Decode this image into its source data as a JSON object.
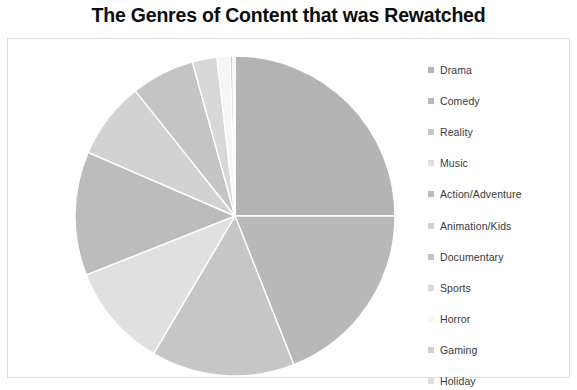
{
  "title": "The Genres of Content that was Rewatched",
  "legend": {
    "position": "right",
    "items": [
      {
        "label": "Drama",
        "color": "#b4b4b4"
      },
      {
        "label": "Comedy",
        "color": "#b8b8b8"
      },
      {
        "label": "Reality",
        "color": "#c6c6c6"
      },
      {
        "label": "Music",
        "color": "#e0e0e0"
      },
      {
        "label": "Action/Adventure",
        "color": "#bcbcbc"
      },
      {
        "label": "Animation/Kids",
        "color": "#d2d2d2"
      },
      {
        "label": "Documentary",
        "color": "#c4c4c4"
      },
      {
        "label": "Sports",
        "color": "#d8d8d8"
      },
      {
        "label": "Horror",
        "color": "#f6f6f6"
      },
      {
        "label": "Gaming",
        "color": "#cfcfcf"
      },
      {
        "label": "Holiday",
        "color": "#dedede"
      }
    ]
  },
  "chart_data": {
    "type": "pie",
    "title": "The Genres of Content that was Rewatched",
    "xlabel": "",
    "ylabel": "",
    "start_angle_deg": 0,
    "direction": "clockwise",
    "center": {
      "x": 235,
      "y": 216
    },
    "radius": 160,
    "categories": [
      "Drama",
      "Comedy",
      "Reality",
      "Music",
      "Action/Adventure",
      "Animation/Kids",
      "Documentary",
      "Sports",
      "Horror",
      "Gaming",
      "Holiday"
    ],
    "values": [
      25.0,
      19.0,
      14.5,
      10.5,
      12.5,
      7.8,
      6.4,
      2.5,
      1.3,
      0.3,
      0.2
    ],
    "colors": [
      "#b4b4b4",
      "#b8b8b8",
      "#c6c6c6",
      "#e0e0e0",
      "#bcbcbc",
      "#d2d2d2",
      "#c4c4c4",
      "#d8d8d8",
      "#f6f6f6",
      "#cfcfcf",
      "#dedede"
    ],
    "units": "percent",
    "grid": false,
    "legend_position": "right"
  }
}
